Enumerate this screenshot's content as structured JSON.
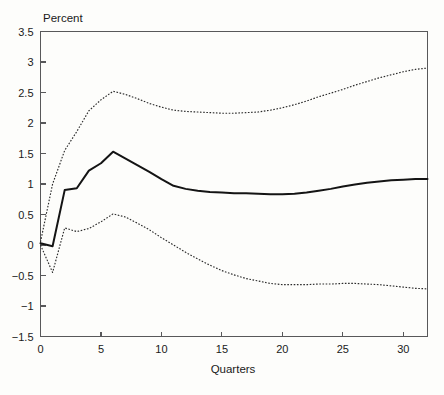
{
  "figure": {
    "background_color": "#fdfdfb",
    "axis_color": "#58585a",
    "solid_line_color": "#141414",
    "dotted_line_color": "#2b2b2b"
  },
  "chart_data": {
    "type": "line",
    "title": "",
    "subtitle": "",
    "xlabel": "Quarters",
    "ylabel": "Percent",
    "ylabel_position": "top-left",
    "xlim": [
      0,
      32
    ],
    "ylim": [
      -1.5,
      3.5
    ],
    "grid": false,
    "legend": false,
    "legend_position": "none",
    "xticks": [
      0,
      5,
      10,
      15,
      20,
      25,
      30
    ],
    "xtick_labels": [
      "0",
      "5",
      "10",
      "15",
      "20",
      "25",
      "30"
    ],
    "yticks": [
      -1.5,
      -1,
      -0.5,
      0,
      0.5,
      1,
      1.5,
      2,
      2.5,
      3,
      3.5
    ],
    "ytick_labels": [
      "-1.5",
      "-1",
      "-0.5",
      "0",
      "0.5",
      "1",
      "1.5",
      "2",
      "2.5",
      "3",
      "3.5"
    ],
    "x": [
      0,
      1,
      2,
      3,
      4,
      5,
      6,
      7,
      8,
      9,
      10,
      11,
      12,
      13,
      14,
      15,
      16,
      17,
      18,
      19,
      20,
      21,
      22,
      23,
      24,
      25,
      26,
      27,
      28,
      29,
      30,
      31,
      32
    ],
    "series": [
      {
        "name": "Impulse response",
        "style": "solid",
        "values": [
          0.03,
          -0.02,
          0.9,
          0.93,
          1.22,
          1.34,
          1.53,
          1.42,
          1.31,
          1.2,
          1.08,
          0.97,
          0.92,
          0.89,
          0.87,
          0.86,
          0.85,
          0.85,
          0.84,
          0.83,
          0.83,
          0.84,
          0.86,
          0.89,
          0.92,
          0.96,
          0.99,
          1.02,
          1.04,
          1.06,
          1.07,
          1.08,
          1.08
        ]
      },
      {
        "name": "Upper confidence band",
        "style": "dotted",
        "values": [
          0.05,
          1.0,
          1.55,
          1.86,
          2.2,
          2.38,
          2.52,
          2.47,
          2.4,
          2.32,
          2.26,
          2.21,
          2.19,
          2.18,
          2.17,
          2.16,
          2.16,
          2.17,
          2.18,
          2.21,
          2.25,
          2.3,
          2.36,
          2.43,
          2.49,
          2.55,
          2.62,
          2.68,
          2.74,
          2.79,
          2.84,
          2.88,
          2.9
        ]
      },
      {
        "name": "Lower confidence band",
        "style": "dotted",
        "values": [
          0.0,
          -0.45,
          0.28,
          0.22,
          0.27,
          0.38,
          0.51,
          0.46,
          0.36,
          0.25,
          0.12,
          0.0,
          -0.12,
          -0.23,
          -0.33,
          -0.42,
          -0.49,
          -0.55,
          -0.59,
          -0.63,
          -0.65,
          -0.65,
          -0.65,
          -0.64,
          -0.64,
          -0.63,
          -0.63,
          -0.64,
          -0.65,
          -0.67,
          -0.69,
          -0.71,
          -0.72
        ]
      }
    ]
  },
  "caption": {
    "text": ""
  }
}
